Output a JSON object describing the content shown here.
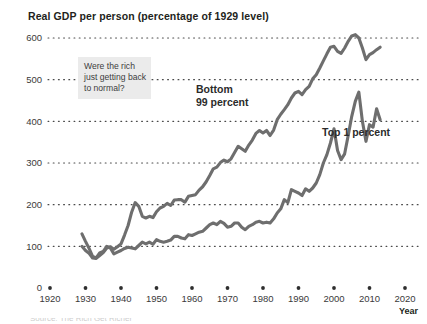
{
  "chart_data": {
    "type": "line",
    "title": "Real GDP per person (percentage of 1929 level)",
    "xlabel": "Year",
    "ylabel": "",
    "xlim": [
      1920,
      2020
    ],
    "ylim": [
      0,
      600
    ],
    "grid": "dotted-horizontal",
    "legend": "inline-annotations",
    "xticks": [
      1920,
      1930,
      1940,
      1950,
      1960,
      1970,
      1980,
      1990,
      2000,
      2010,
      2020
    ],
    "yticks": [
      0,
      100,
      200,
      300,
      400,
      500,
      600
    ],
    "annotations": [
      {
        "name": "were-the-rich-note",
        "text_lines": [
          "Were the rich",
          "just getting back",
          "to normal?"
        ],
        "style": "grey-box"
      },
      {
        "name": "bottom-99-label",
        "text_lines": [
          "Bottom",
          "99 percent"
        ]
      },
      {
        "name": "top-1-label",
        "text_lines": [
          "Top 1 percent"
        ]
      }
    ],
    "series": [
      {
        "name": "Bottom 99 percent",
        "color": "#6e6e6e",
        "x": [
          1929,
          1930,
          1931,
          1932,
          1933,
          1934,
          1935,
          1936,
          1937,
          1938,
          1939,
          1940,
          1941,
          1942,
          1943,
          1944,
          1945,
          1946,
          1947,
          1948,
          1949,
          1950,
          1951,
          1952,
          1953,
          1954,
          1955,
          1956,
          1957,
          1958,
          1959,
          1960,
          1961,
          1962,
          1963,
          1964,
          1965,
          1966,
          1967,
          1968,
          1969,
          1970,
          1971,
          1972,
          1973,
          1974,
          1975,
          1976,
          1977,
          1978,
          1979,
          1980,
          1981,
          1982,
          1983,
          1984,
          1985,
          1986,
          1987,
          1988,
          1989,
          1990,
          1991,
          1992,
          1993,
          1994,
          1995,
          1996,
          1997,
          1998,
          1999,
          2000,
          2001,
          2002,
          2003,
          2004,
          2005,
          2006,
          2007,
          2008,
          2009,
          2010,
          2011,
          2012,
          2013
        ],
        "y": [
          100,
          90,
          83,
          72,
          71,
          78,
          85,
          96,
          99,
          93,
          99,
          106,
          127,
          150,
          182,
          205,
          196,
          172,
          168,
          172,
          169,
          183,
          192,
          196,
          203,
          198,
          211,
          212,
          212,
          206,
          220,
          222,
          224,
          235,
          243,
          255,
          270,
          286,
          290,
          301,
          307,
          303,
          310,
          325,
          340,
          334,
          328,
          343,
          355,
          371,
          378,
          372,
          378,
          366,
          379,
          404,
          417,
          428,
          440,
          456,
          468,
          472,
          464,
          476,
          484,
          502,
          512,
          528,
          545,
          562,
          578,
          580,
          568,
          563,
          576,
          592,
          605,
          608,
          600,
          576,
          548,
          560,
          565,
          572,
          578
        ],
        "y_note": "Indexed to 1929 = 100"
      },
      {
        "name": "Top 1 percent",
        "color": "#6e6e6e",
        "x": [
          1929,
          1930,
          1931,
          1932,
          1933,
          1934,
          1935,
          1936,
          1937,
          1938,
          1939,
          1940,
          1941,
          1942,
          1943,
          1944,
          1945,
          1946,
          1947,
          1948,
          1949,
          1950,
          1951,
          1952,
          1953,
          1954,
          1955,
          1956,
          1957,
          1958,
          1959,
          1960,
          1961,
          1962,
          1963,
          1964,
          1965,
          1966,
          1967,
          1968,
          1969,
          1970,
          1971,
          1972,
          1973,
          1974,
          1975,
          1976,
          1977,
          1978,
          1979,
          1980,
          1981,
          1982,
          1983,
          1984,
          1985,
          1986,
          1987,
          1988,
          1989,
          1990,
          1991,
          1992,
          1993,
          1994,
          1995,
          1996,
          1997,
          1998,
          1999,
          2000,
          2001,
          2002,
          2003,
          2004,
          2005,
          2006,
          2007,
          2008,
          2009,
          2010,
          2011,
          2012,
          2013
        ],
        "y": [
          130,
          112,
          95,
          76,
          72,
          84,
          88,
          100,
          96,
          82,
          86,
          90,
          95,
          98,
          96,
          94,
          102,
          110,
          106,
          110,
          105,
          116,
          112,
          110,
          112,
          115,
          124,
          124,
          120,
          118,
          128,
          126,
          130,
          134,
          136,
          144,
          152,
          156,
          152,
          160,
          155,
          146,
          148,
          156,
          156,
          146,
          140,
          148,
          152,
          158,
          160,
          156,
          158,
          156,
          166,
          180,
          190,
          212,
          205,
          236,
          232,
          228,
          222,
          238,
          232,
          240,
          252,
          272,
          300,
          320,
          348,
          382,
          330,
          308,
          322,
          366,
          412,
          448,
          470,
          400,
          352,
          392,
          386,
          430,
          404
        ],
        "y_note": "Indexed to 1929 = 100"
      }
    ]
  },
  "footer": {
    "caption_faint": "Source: The Rich Get Richer"
  }
}
